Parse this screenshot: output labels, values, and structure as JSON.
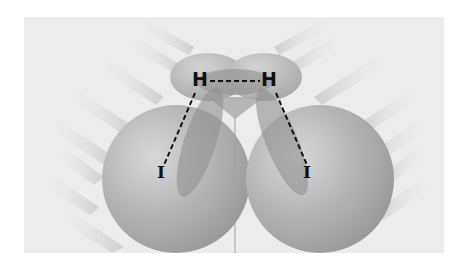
{
  "diagram": {
    "atoms": [
      {
        "label": "H",
        "id": "h-left"
      },
      {
        "label": "H",
        "id": "h-right"
      },
      {
        "label": "I",
        "id": "i-left"
      },
      {
        "label": "I",
        "id": "i-right"
      }
    ],
    "bonds": [
      {
        "from": "h-left",
        "to": "h-right",
        "style": "dashed"
      },
      {
        "from": "h-left",
        "to": "i-left",
        "style": "dashed"
      },
      {
        "from": "h-right",
        "to": "i-right",
        "style": "dashed"
      }
    ],
    "colors": {
      "background": "#ececec",
      "sphere": "#b8b8b8",
      "lobe": "#8f8f8f",
      "bond": "#111111"
    }
  }
}
